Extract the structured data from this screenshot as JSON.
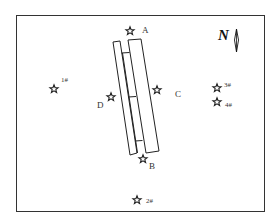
{
  "diagram": {
    "type": "site plan",
    "north_label": "N",
    "structures": [
      {
        "name": "left-strip"
      },
      {
        "name": "middle-strip"
      },
      {
        "name": "right-strip"
      }
    ],
    "points": [
      {
        "id": "A",
        "label": "A",
        "x": 130,
        "y": 31
      },
      {
        "id": "B",
        "label": "B",
        "x": 143,
        "y": 159
      },
      {
        "id": "C",
        "label": "C",
        "x": 157,
        "y": 90
      },
      {
        "id": "D",
        "label": "D",
        "x": 111,
        "y": 97
      },
      {
        "id": "1",
        "label": "1#",
        "x": 54,
        "y": 89
      },
      {
        "id": "2",
        "label": "2#",
        "x": 137,
        "y": 200
      },
      {
        "id": "3",
        "label": "3#",
        "x": 217,
        "y": 88
      },
      {
        "id": "4",
        "label": "4#",
        "x": 217,
        "y": 102
      }
    ]
  },
  "labels": {
    "A": "A",
    "B": "B",
    "C": "C",
    "D": "D",
    "p1": "1#",
    "p2": "2#",
    "p3": "3#",
    "p4": "4#",
    "north": "N"
  }
}
